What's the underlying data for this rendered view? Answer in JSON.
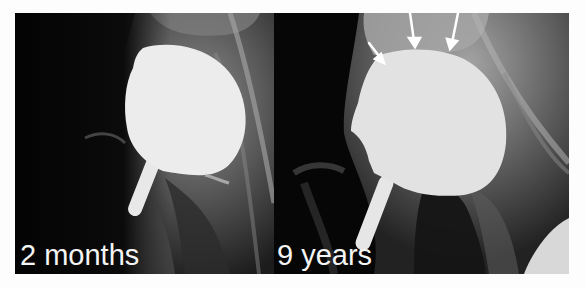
{
  "figure": {
    "panels": [
      {
        "label": "2 months",
        "description": "Hip X-ray with resurfacing implant, 2 months post-op"
      },
      {
        "label": "9 years",
        "description": "Hip X-ray with resurfacing implant, 9 years post-op, with arrows indicating bone changes",
        "annotations": [
          {
            "type": "arrow",
            "count": 3,
            "color": "#ffffff"
          }
        ]
      }
    ]
  },
  "colors": {
    "background": "#fdfdfd",
    "xray_dark": "#050505",
    "implant": "#ececec",
    "label_text": "#f4f4f4"
  }
}
